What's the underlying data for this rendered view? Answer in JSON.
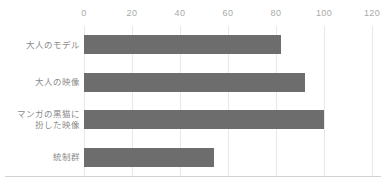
{
  "chart_data": {
    "type": "bar",
    "orientation": "horizontal",
    "title": "",
    "subtitle": "",
    "xlabel": "",
    "ylabel": "",
    "categories": [
      "大人のモデル",
      "大人の映像",
      "マンガの黒猫に\n扮した映像",
      "統制群"
    ],
    "values": [
      82,
      92,
      100,
      54
    ],
    "xlim": [
      0,
      120
    ],
    "xticks": [
      0,
      20,
      40,
      60,
      80,
      100,
      120
    ],
    "xtick_labels": [
      "0",
      "20",
      "40",
      "60",
      "80",
      "100",
      "120"
    ],
    "axis_position": "top",
    "grid": {
      "vertical": true,
      "horizontal": false
    },
    "legend": {
      "visible": false,
      "position": "none"
    },
    "colors": {
      "bar": "#6d6d6d",
      "gridline": "#e8e8e8",
      "baseline": "#d2d2d2",
      "tick_label": "#a9a9a9",
      "category_label": "#8a8a8a",
      "background": "#ffffff"
    }
  }
}
